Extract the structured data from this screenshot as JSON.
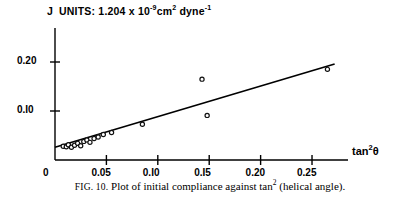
{
  "figure": {
    "units_note": {
      "symbol": "J",
      "text": "UNITS: 1.204 x 10",
      "exp1": "-9",
      "mid": "cm",
      "exp2": "2",
      "tail": " dyne",
      "exp3": "-1"
    },
    "caption": {
      "fig_label": "FIG. 10.",
      "text": " Plot of initial compliance against tan",
      "sup": "2",
      "tail": " (helical angle)."
    }
  },
  "chart_data": {
    "type": "scatter",
    "title": "",
    "xlabel": "tan²θ",
    "xlabel_base": "tan",
    "xlabel_sup": "2",
    "xlabel_theta": "θ",
    "ylabel": "",
    "origin_label": "0",
    "xlim": [
      0.0,
      0.285
    ],
    "ylim": [
      0.0,
      0.225
    ],
    "xticks": [
      0.05,
      0.1,
      0.15,
      0.2,
      0.25
    ],
    "xticklabels": [
      "0.05",
      "0.I0",
      "0.I5",
      "0.20",
      "0.25"
    ],
    "yticks": [
      0.1,
      0.2
    ],
    "yticklabels": [
      "0.I0",
      "0.20"
    ],
    "grid": false,
    "legend": null,
    "marker": "open-circle",
    "points": [
      {
        "x": 0.008,
        "y": 0.028
      },
      {
        "x": 0.011,
        "y": 0.027
      },
      {
        "x": 0.013,
        "y": 0.031
      },
      {
        "x": 0.016,
        "y": 0.026
      },
      {
        "x": 0.019,
        "y": 0.03
      },
      {
        "x": 0.022,
        "y": 0.034
      },
      {
        "x": 0.025,
        "y": 0.029
      },
      {
        "x": 0.028,
        "y": 0.038
      },
      {
        "x": 0.031,
        "y": 0.041
      },
      {
        "x": 0.034,
        "y": 0.036
      },
      {
        "x": 0.038,
        "y": 0.044
      },
      {
        "x": 0.042,
        "y": 0.047
      },
      {
        "x": 0.047,
        "y": 0.052
      },
      {
        "x": 0.055,
        "y": 0.056
      },
      {
        "x": 0.085,
        "y": 0.073
      },
      {
        "x": 0.143,
        "y": 0.165
      },
      {
        "x": 0.148,
        "y": 0.091
      },
      {
        "x": 0.265,
        "y": 0.185
      }
    ],
    "fit_line": {
      "x0": 0.0,
      "y0": 0.026,
      "x1": 0.272,
      "y1": 0.196
    }
  }
}
